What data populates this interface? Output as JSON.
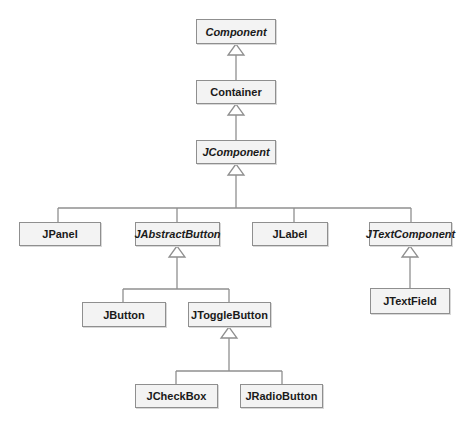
{
  "diagram": {
    "type": "UML class hierarchy (Swing)",
    "colors": {
      "box_fill": "#f3f3f3",
      "box_border": "#8f8f8f",
      "line": "#8f8f8f",
      "text": "#1a1a1a"
    },
    "nodes": [
      {
        "id": "component",
        "label": "Component",
        "abstract": true
      },
      {
        "id": "container",
        "label": "Container",
        "abstract": false
      },
      {
        "id": "jcomponent",
        "label": "JComponent",
        "abstract": true
      },
      {
        "id": "jpanel",
        "label": "JPanel",
        "abstract": false
      },
      {
        "id": "jabstractbutton",
        "label": "JAbstractButton",
        "abstract": true
      },
      {
        "id": "jlabel",
        "label": "JLabel",
        "abstract": false
      },
      {
        "id": "jtextcomponent",
        "label": "JTextComponent",
        "abstract": true
      },
      {
        "id": "jtextfield",
        "label": "JTextField",
        "abstract": false
      },
      {
        "id": "jbutton",
        "label": "JButton",
        "abstract": false
      },
      {
        "id": "jtogglebutton",
        "label": "JToggleButton",
        "abstract": false
      },
      {
        "id": "jcheckbox",
        "label": "JCheckBox",
        "abstract": false
      },
      {
        "id": "jradiobutton",
        "label": "JRadioButton",
        "abstract": false
      }
    ],
    "edges": [
      {
        "child": "Container",
        "parent": "Component",
        "kind": "inheritance"
      },
      {
        "child": "JComponent",
        "parent": "Container",
        "kind": "inheritance"
      },
      {
        "child": "JPanel",
        "parent": "JComponent",
        "kind": "inheritance"
      },
      {
        "child": "JAbstractButton",
        "parent": "JComponent",
        "kind": "inheritance"
      },
      {
        "child": "JLabel",
        "parent": "JComponent",
        "kind": "inheritance"
      },
      {
        "child": "JTextComponent",
        "parent": "JComponent",
        "kind": "inheritance"
      },
      {
        "child": "JTextField",
        "parent": "JTextComponent",
        "kind": "inheritance"
      },
      {
        "child": "JButton",
        "parent": "JAbstractButton",
        "kind": "inheritance"
      },
      {
        "child": "JToggleButton",
        "parent": "JAbstractButton",
        "kind": "inheritance"
      },
      {
        "child": "JCheckBox",
        "parent": "JToggleButton",
        "kind": "inheritance"
      },
      {
        "child": "JRadioButton",
        "parent": "JToggleButton",
        "kind": "inheritance"
      }
    ]
  }
}
